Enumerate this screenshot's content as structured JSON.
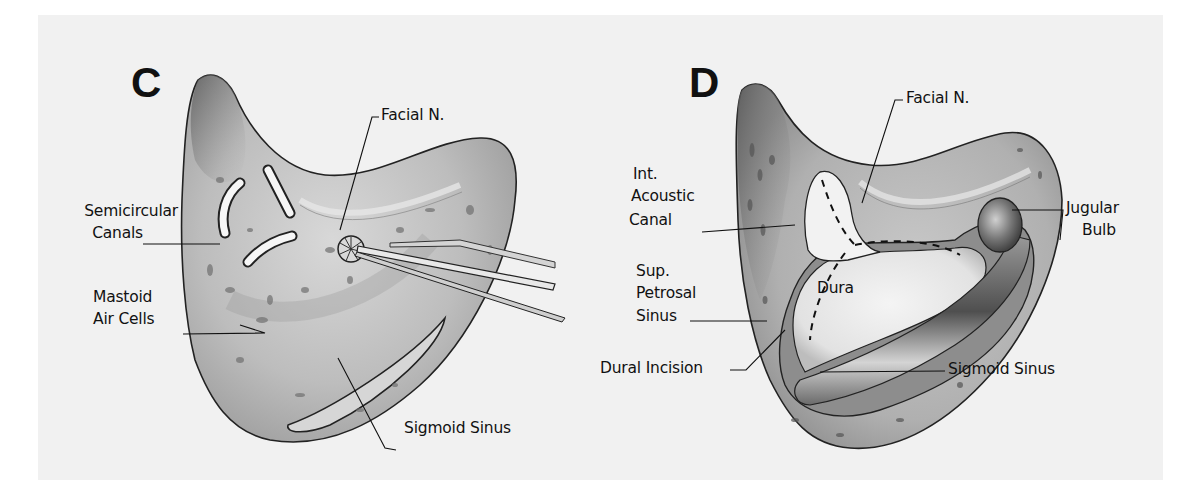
{
  "figure": {
    "type": "anatomical surgical illustration",
    "panels": [
      {
        "id": "C",
        "letter": "C",
        "labels": {
          "facial_n": "Facial N.",
          "semicircular_1": "Semicircular",
          "semicircular_2": "Canals",
          "mastoid_1": "Mastoid",
          "mastoid_2": "Air Cells",
          "sigmoid": "Sigmoid Sinus"
        },
        "instrument": "drill-burr-icon"
      },
      {
        "id": "D",
        "letter": "D",
        "labels": {
          "facial_n": "Facial N.",
          "iac_1": "Int.",
          "iac_2": "Acoustic",
          "iac_3": "Canal",
          "jugular_1": "Jugular",
          "jugular_2": "Bulb",
          "sps_1": "Sup.",
          "sps_2": "Petrosal",
          "sps_3": "Sinus",
          "dura": "Dura",
          "dural_incision": "Dural Incision",
          "sigmoid": "Sigmoid Sinus"
        }
      }
    ],
    "colors": {
      "background": "#f1f1f1",
      "bone": "#b9b9b9",
      "bone_dark": "#6e6e6e",
      "ink": "#111111",
      "dura": "#ececec",
      "sinus": "#8a8a8a"
    }
  }
}
